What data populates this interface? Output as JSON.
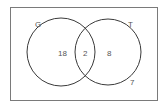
{
  "diagram": {
    "type": "venn",
    "universe_label": "",
    "sets": [
      {
        "name": "G",
        "only_count": "18"
      },
      {
        "name": "T",
        "only_count": "8"
      }
    ],
    "intersection_count": "2",
    "outside_count": "7",
    "colors": {
      "stroke": "#3a3a3a",
      "text": "#555555",
      "background": "#ffffff"
    }
  }
}
